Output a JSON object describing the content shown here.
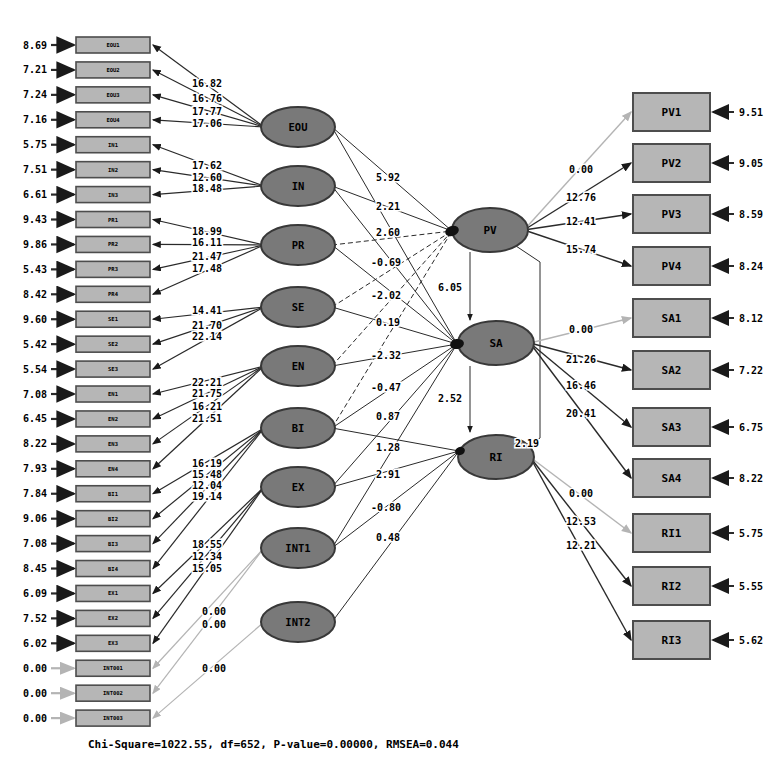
{
  "diagram": {
    "left_indicators": [
      {
        "label": "EOU1",
        "error": "8.69"
      },
      {
        "label": "EOU2",
        "error": "7.21"
      },
      {
        "label": "EOU3",
        "error": "7.24"
      },
      {
        "label": "EOU4",
        "error": "7.16"
      },
      {
        "label": "IN1",
        "error": "5.75"
      },
      {
        "label": "IN2",
        "error": "7.51"
      },
      {
        "label": "IN3",
        "error": "6.61"
      },
      {
        "label": "PR1",
        "error": "9.43"
      },
      {
        "label": "PR2",
        "error": "9.86"
      },
      {
        "label": "PR3",
        "error": "5.43"
      },
      {
        "label": "PR4",
        "error": "8.42"
      },
      {
        "label": "SE1",
        "error": "9.60"
      },
      {
        "label": "SE2",
        "error": "5.42"
      },
      {
        "label": "SE3",
        "error": "5.54"
      },
      {
        "label": "EN1",
        "error": "7.08"
      },
      {
        "label": "EN2",
        "error": "6.45"
      },
      {
        "label": "EN3",
        "error": "8.22"
      },
      {
        "label": "EN4",
        "error": "7.93"
      },
      {
        "label": "BI1",
        "error": "7.84"
      },
      {
        "label": "BI2",
        "error": "9.06"
      },
      {
        "label": "BI3",
        "error": "7.08"
      },
      {
        "label": "BI4",
        "error": "8.45"
      },
      {
        "label": "EX1",
        "error": "6.09"
      },
      {
        "label": "EX2",
        "error": "7.52"
      },
      {
        "label": "EX3",
        "error": "6.02"
      },
      {
        "label": "INT001",
        "error": "0.00"
      },
      {
        "label": "INT002",
        "error": "0.00"
      },
      {
        "label": "INT003",
        "error": "0.00"
      }
    ],
    "left_factors": [
      {
        "name": "EOU",
        "loadings": [
          "16.82",
          "16.76",
          "17.77",
          "17.06"
        ]
      },
      {
        "name": "IN",
        "loadings": [
          "17.62",
          "12.60",
          "18.48"
        ]
      },
      {
        "name": "PR",
        "loadings": [
          "18.99",
          "16.11",
          "21.47",
          "17.48"
        ]
      },
      {
        "name": "SE",
        "loadings": [
          "14.41",
          "21.70",
          "22.14"
        ]
      },
      {
        "name": "EN",
        "loadings": [
          "22.21",
          "21.75",
          "16.21",
          "21.51"
        ]
      },
      {
        "name": "BI",
        "loadings": [
          "16.19",
          "15.48",
          "12.04",
          "19.14"
        ]
      },
      {
        "name": "EX",
        "loadings": [
          "18.55",
          "12.34",
          "15.05"
        ]
      },
      {
        "name": "INT1",
        "loadings": [
          "0.00",
          "0.00"
        ]
      },
      {
        "name": "INT2",
        "loadings": [
          "0.00"
        ]
      }
    ],
    "right_factors": [
      {
        "name": "PV",
        "loadings": [
          "0.00",
          "12.76",
          "12.41",
          "15.74"
        ]
      },
      {
        "name": "SA",
        "loadings": [
          "0.00",
          "21.26",
          "16.46",
          "20.41"
        ]
      },
      {
        "name": "RI",
        "loadings": [
          "0.00",
          "12.53",
          "12.21"
        ]
      }
    ],
    "right_indicators": [
      {
        "label": "PV1",
        "error": "9.51"
      },
      {
        "label": "PV2",
        "error": "9.05"
      },
      {
        "label": "PV3",
        "error": "8.59"
      },
      {
        "label": "PV4",
        "error": "8.24"
      },
      {
        "label": "SA1",
        "error": "8.12"
      },
      {
        "label": "SA2",
        "error": "7.22"
      },
      {
        "label": "SA3",
        "error": "6.75"
      },
      {
        "label": "SA4",
        "error": "8.22"
      },
      {
        "label": "RI1",
        "error": "5.75"
      },
      {
        "label": "RI2",
        "error": "5.55"
      },
      {
        "label": "RI3",
        "error": "5.62"
      }
    ],
    "path_coefficients": [
      "5.92",
      "2.21",
      "2.60",
      "-0.69",
      "-2.02",
      "0.19",
      "-2.32",
      "-0.47",
      "0.87",
      "1.28",
      "2.91",
      "-0.80",
      "0.48"
    ],
    "structural_links": {
      "pv_sa": "6.05",
      "sa_ri": "2.52",
      "pv_ri": "2.19"
    },
    "footer": "Chi-Square=1022.55, df=652, P-value=0.00000, RMSEA=0.044",
    "colors": {
      "background": "#ffffff",
      "box_fill": "#b6b6b6",
      "box_border": "#4d4d4d",
      "oval_fill": "#797979",
      "oval_border": "#383838",
      "line_dark": "#2a2a2a",
      "line_gray": "#b4b4b4",
      "text": "#000000"
    }
  }
}
